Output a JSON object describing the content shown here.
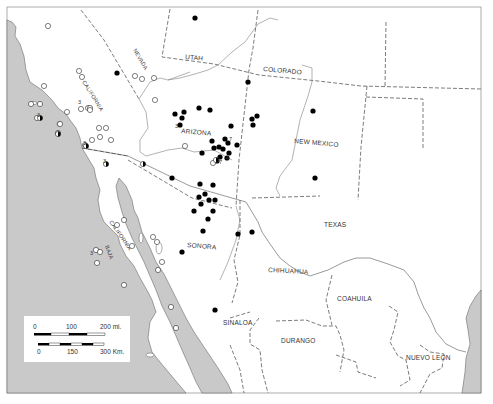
{
  "map": {
    "colors": {
      "ocean": "#c9c9c9",
      "land": "#ffffff",
      "border": "#555555",
      "frame": "#999999",
      "present_dot": "#000000",
      "absent_dot": "#ffffff"
    },
    "labels": {
      "nevada": "NEVADA",
      "utah": "UTAH",
      "colorado": "COLORADO",
      "california": "CALIFORNIA",
      "arizona": "ARIZONA",
      "new_mexico": "NEW MEXICO",
      "texas": "TEXAS",
      "baja": "BAJA",
      "baja_california": "CALIFORNIA",
      "sonora": "SONORA",
      "chihuahua": "CHIHUAHUA",
      "coahuila": "COAHUILA",
      "sinaloa": "SINALOA",
      "durango": "DURANGO",
      "nuevo_leon": "NUEVO LEON"
    },
    "scale_bar": {
      "miles": {
        "labels": [
          "0",
          "100",
          "200 mi."
        ]
      },
      "km": {
        "labels": [
          "0",
          "150",
          "300 Km."
        ]
      }
    },
    "filled_points": [
      [
        195,
        18
      ],
      [
        117,
        73
      ],
      [
        248,
        82
      ],
      [
        175,
        114
      ],
      [
        182,
        118
      ],
      [
        184,
        112
      ],
      [
        199,
        108
      ],
      [
        180,
        125
      ],
      [
        210,
        110
      ],
      [
        231,
        126
      ],
      [
        257,
        116
      ],
      [
        252,
        119
      ],
      [
        253,
        125
      ],
      [
        212,
        141
      ],
      [
        219,
        147
      ],
      [
        225,
        139
      ],
      [
        228,
        143
      ],
      [
        223,
        149
      ],
      [
        237,
        145
      ],
      [
        229,
        153
      ],
      [
        227,
        158
      ],
      [
        214,
        148
      ],
      [
        220,
        157
      ],
      [
        202,
        153
      ],
      [
        217,
        161
      ],
      [
        172,
        178
      ],
      [
        200,
        184
      ],
      [
        213,
        185
      ],
      [
        199,
        197
      ],
      [
        201,
        204
      ],
      [
        205,
        194
      ],
      [
        209,
        200
      ],
      [
        215,
        200
      ],
      [
        213,
        211
      ],
      [
        194,
        211
      ],
      [
        208,
        219
      ],
      [
        203,
        231
      ],
      [
        182,
        252
      ],
      [
        238,
        234
      ],
      [
        252,
        232
      ],
      [
        215,
        310
      ],
      [
        313,
        111
      ],
      [
        315,
        178
      ]
    ],
    "open_points": [
      [
        48,
        26
      ],
      [
        44,
        86
      ],
      [
        79,
        71
      ],
      [
        82,
        77
      ],
      [
        88,
        108
      ],
      [
        90,
        108
      ],
      [
        67,
        112
      ],
      [
        81,
        109
      ],
      [
        90,
        110
      ],
      [
        135,
        76
      ],
      [
        142,
        79
      ],
      [
        155,
        100
      ],
      [
        99,
        128
      ],
      [
        106,
        128
      ],
      [
        92,
        140
      ],
      [
        100,
        137
      ],
      [
        111,
        140
      ],
      [
        85,
        145
      ],
      [
        185,
        146
      ],
      [
        154,
        78
      ],
      [
        213,
        163
      ],
      [
        40,
        104
      ],
      [
        37,
        118
      ],
      [
        60,
        124
      ],
      [
        58,
        133
      ],
      [
        31,
        104
      ],
      [
        96,
        250
      ],
      [
        100,
        252
      ],
      [
        132,
        246
      ],
      [
        124,
        285
      ],
      [
        171,
        307
      ],
      [
        176,
        328
      ],
      [
        97,
        263
      ],
      [
        153,
        237
      ],
      [
        157,
        242
      ],
      [
        162,
        262
      ],
      [
        117,
        225
      ],
      [
        124,
        220
      ],
      [
        158,
        270
      ]
    ],
    "half_points": [
      [
        86,
        146
      ],
      [
        106,
        164
      ],
      [
        143,
        164
      ],
      [
        216,
        160
      ],
      [
        58,
        134
      ],
      [
        40,
        118
      ]
    ],
    "numbered_annotations": [
      {
        "text": "3",
        "x": 175,
        "y": 128
      },
      {
        "text": "7",
        "x": 229,
        "y": 141
      },
      {
        "text": "4",
        "x": 226,
        "y": 160
      },
      {
        "text": "7",
        "x": 219,
        "y": 164
      },
      {
        "text": "3",
        "x": 78,
        "y": 104
      },
      {
        "text": "3",
        "x": 37,
        "y": 117
      },
      {
        "text": "3",
        "x": 83,
        "y": 145
      },
      {
        "text": "3",
        "x": 103,
        "y": 163
      },
      {
        "text": "3",
        "x": 90,
        "y": 255
      }
    ]
  }
}
